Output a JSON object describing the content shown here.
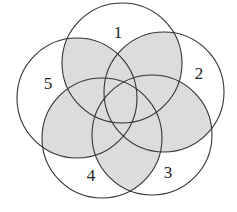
{
  "diagram": {
    "type": "venn",
    "colors": {
      "background": "#ffffff",
      "shade": "#dcdcdc",
      "stroke": "#333333"
    },
    "circles": [
      {
        "id": "1",
        "label": "1",
        "cx": 122,
        "cy": 63,
        "r": 60,
        "label_x": 118,
        "label_y": 38
      },
      {
        "id": "2",
        "label": "2",
        "cx": 164,
        "cy": 92,
        "r": 60,
        "label_x": 199,
        "label_y": 79
      },
      {
        "id": "3",
        "label": "3",
        "cx": 152,
        "cy": 135,
        "r": 60,
        "label_x": 168,
        "label_y": 178
      },
      {
        "id": "4",
        "label": "4",
        "cx": 102,
        "cy": 138,
        "r": 60,
        "label_x": 91,
        "label_y": 181
      },
      {
        "id": "5",
        "label": "5",
        "cx": 77,
        "cy": 98,
        "r": 60,
        "label_x": 48,
        "label_y": 89
      }
    ],
    "shaded_region": "overlap of at least two circles"
  }
}
